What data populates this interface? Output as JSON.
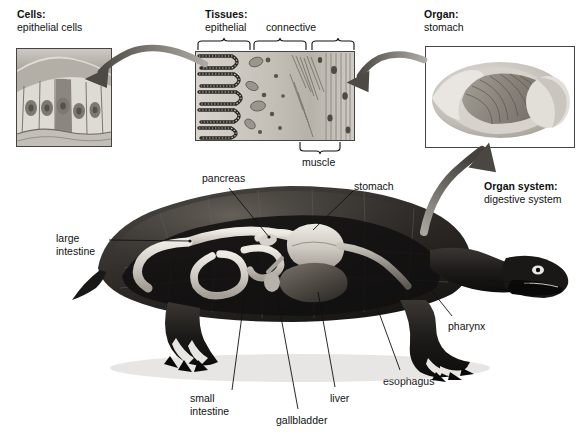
{
  "figure": {
    "title_hidden": "Levels of biological organization in a turtle",
    "background": "#ffffff",
    "ink": "#111111"
  },
  "panels": [
    {
      "id": "cells",
      "heading_bold": "Cells:",
      "heading_sub": "epithelial cells",
      "frame": {
        "x": 16,
        "y": 48,
        "w": 96,
        "h": 99
      },
      "inset_box": null
    },
    {
      "id": "tissues",
      "heading_bold": "Tissues:",
      "heading_sub": "epithelial",
      "frame": {
        "x": 195,
        "y": 51,
        "w": 160,
        "h": 90
      },
      "inset_box": {
        "x": 216,
        "y": 57,
        "w": 22,
        "h": 14
      }
    },
    {
      "id": "organ",
      "heading_bold": "Organ:",
      "heading_sub": "stomach",
      "frame": {
        "x": 425,
        "y": 46,
        "w": 150,
        "h": 102
      },
      "inset_box": {
        "x": 517,
        "y": 78,
        "w": 32,
        "h": 17
      }
    }
  ],
  "tissue_braces": [
    {
      "label": "epithelial",
      "side": "top",
      "x": 198,
      "y": 44,
      "w": 52
    },
    {
      "label": "connective",
      "side": "top",
      "x": 252,
      "y": 44,
      "w": 100
    },
    {
      "label": "muscle",
      "side": "bottom",
      "x": 298,
      "y": 142,
      "w": 46
    }
  ],
  "organ_system": {
    "heading_bold": "Organ system:",
    "heading_sub": "digestive system"
  },
  "turtle_inset_box": {
    "x": 288,
    "y": 229,
    "w": 45,
    "h": 38
  },
  "callouts": [
    {
      "name": "pancreas",
      "text": "pancreas",
      "tx": 202,
      "ty": 172,
      "align": "left",
      "lx1": 229,
      "ly1": 188,
      "lx2": 269,
      "ly2": 237
    },
    {
      "name": "stomach",
      "text": "stomach",
      "tx": 354,
      "ty": 180,
      "align": "left",
      "lx1": 353,
      "ly1": 191,
      "lx2": 313,
      "ly2": 230
    },
    {
      "name": "large-intestine",
      "text": "large\nintestine",
      "tx": 56,
      "ty": 232,
      "align": "left",
      "lx1": 109,
      "ly1": 240,
      "lx2": 190,
      "ly2": 241
    },
    {
      "name": "mouth",
      "text": "mouth",
      "tx": 533,
      "ty": 277,
      "align": "left",
      "lx1": 530,
      "ly1": 283,
      "lx2": 491,
      "ly2": 281
    },
    {
      "name": "pharynx",
      "text": "pharynx",
      "tx": 448,
      "ty": 320,
      "align": "left",
      "lx1": 452,
      "ly1": 316,
      "lx2": 424,
      "ly2": 281
    },
    {
      "name": "esophagus",
      "text": "esophagus",
      "tx": 383,
      "ty": 375,
      "align": "left",
      "lx1": 400,
      "ly1": 370,
      "lx2": 374,
      "ly2": 299
    },
    {
      "name": "liver",
      "text": "liver",
      "tx": 330,
      "ty": 392,
      "align": "left",
      "lx1": 335,
      "ly1": 387,
      "lx2": 318,
      "ly2": 292
    },
    {
      "name": "gallbladder",
      "text": "gallbladder",
      "tx": 276,
      "ty": 414,
      "align": "left",
      "lx1": 298,
      "ly1": 409,
      "lx2": 276,
      "ly2": 290
    },
    {
      "name": "small-intestine",
      "text": "small\nintestine",
      "tx": 190,
      "ty": 392,
      "align": "left",
      "lx1": 232,
      "ly1": 390,
      "lx2": 245,
      "ly2": 293
    }
  ],
  "arrows": [
    {
      "name": "tissues-to-cells",
      "from": "tissues-inset",
      "to": "cells-panel"
    },
    {
      "name": "organ-to-tissues",
      "from": "organ-inset",
      "to": "tissues-panel"
    },
    {
      "name": "turtle-to-organ",
      "from": "turtle-inset",
      "to": "organ-panel"
    }
  ]
}
